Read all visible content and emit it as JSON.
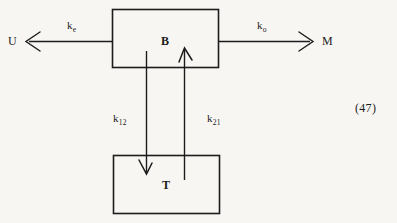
{
  "figure": {
    "background_color": "#f7f6f3",
    "stroke_color": "#1c1c1c",
    "equation_number": "(47)",
    "nodes": [
      {
        "id": "B",
        "label": "B",
        "x": 112,
        "y": 9,
        "width": 107,
        "height": 59
      },
      {
        "id": "T",
        "label": "T",
        "x": 113,
        "y": 155,
        "width": 107,
        "height": 59
      }
    ],
    "terminals": [
      {
        "id": "U",
        "label": "U",
        "side": "left"
      },
      {
        "id": "M",
        "label": "M",
        "side": "right"
      }
    ],
    "edges": [
      {
        "id": "B-to-U",
        "label": "k",
        "subscript": "e",
        "from": "B",
        "to": "U",
        "direction": "left",
        "arrowhead": "open"
      },
      {
        "id": "B-to-M",
        "label": "k",
        "subscript": "o",
        "from": "B",
        "to": "M",
        "direction": "right",
        "arrowhead": "open"
      },
      {
        "id": "B-to-T",
        "label": "k",
        "subscript": "12",
        "from": "B",
        "to": "T",
        "direction": "down",
        "arrowhead": "open"
      },
      {
        "id": "T-to-B",
        "label": "k",
        "subscript": "21",
        "from": "T",
        "to": "B",
        "direction": "up",
        "arrowhead": "open"
      }
    ]
  }
}
